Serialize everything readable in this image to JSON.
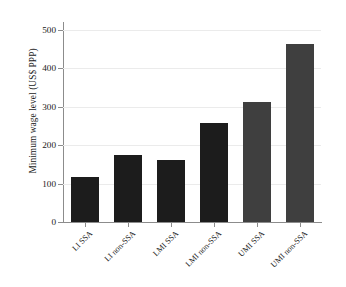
{
  "chart_data": {
    "type": "bar",
    "title": "",
    "xlabel": "",
    "ylabel": "Minimum wage level (US$ PPP)",
    "categories": [
      "LI SSA",
      "LI non-SSA",
      "LMI SSA",
      "LMI non-SSA",
      "UMI SSA",
      "UMI non-SSA"
    ],
    "values": [
      117,
      175,
      162,
      258,
      312,
      462
    ],
    "ylim": [
      0,
      520
    ],
    "yticks": [
      0,
      100,
      200,
      300,
      400,
      500
    ],
    "ytick_labels": [
      "0",
      "100",
      "200",
      "300",
      "400",
      "500"
    ],
    "grid": true,
    "legend": "none",
    "bar_colors": [
      "#1c1c1c",
      "#1c1c1c",
      "#1c1c1c",
      "#1c1c1c",
      "#3f3f3f",
      "#3f3f3f"
    ],
    "series": [
      {
        "name": "Minimum wage level",
        "values": [
          117,
          175,
          162,
          258,
          312,
          462
        ]
      }
    ]
  },
  "colors": {
    "background": "#ffffff",
    "bar_dark": "#1c1c1c",
    "bar_gray": "#3f3f3f",
    "gridline": "#ebebeb",
    "axis": "#8c8c8c",
    "text": "#1a1a1a"
  }
}
